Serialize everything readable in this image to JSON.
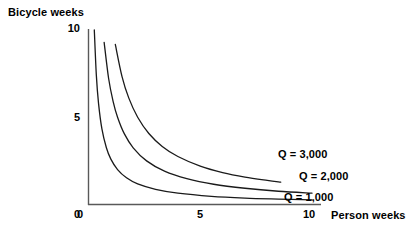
{
  "chart_data": {
    "type": "line",
    "title": "",
    "xlabel": "Person weeks",
    "ylabel": "Bicycle weeks",
    "xlim": [
      0,
      11.5
    ],
    "ylim": [
      0,
      11.8
    ],
    "xticks": [
      "0",
      "5",
      "10"
    ],
    "xtick_values": [
      0,
      5,
      10
    ],
    "yticks": [
      "0",
      "5",
      "10"
    ],
    "ytick_values": [
      0,
      5,
      10
    ],
    "grid": false,
    "legend_position": "inline-right-of-curve-ends",
    "axis_color": "#4d4d4d",
    "curve_color": "#1a1a1a",
    "background": "#ffffff",
    "series": [
      {
        "name": "Q = 1,000",
        "label": "Q = 1,000",
        "constant": 2.6,
        "points": [
          {
            "x": 0.26,
            "y": 10.0
          },
          {
            "x": 0.35,
            "y": 7.43
          },
          {
            "x": 0.45,
            "y": 5.78
          },
          {
            "x": 0.6,
            "y": 4.33
          },
          {
            "x": 0.8,
            "y": 3.25
          },
          {
            "x": 1.0,
            "y": 2.6
          },
          {
            "x": 1.3,
            "y": 2.0
          },
          {
            "x": 1.7,
            "y": 1.53
          },
          {
            "x": 2.2,
            "y": 1.18
          },
          {
            "x": 3.0,
            "y": 0.87
          },
          {
            "x": 4.0,
            "y": 0.65
          },
          {
            "x": 5.5,
            "y": 0.47
          },
          {
            "x": 7.0,
            "y": 0.37
          },
          {
            "x": 8.5,
            "y": 0.31
          },
          {
            "x": 10.0,
            "y": 0.26
          }
        ]
      },
      {
        "name": "Q = 2,000",
        "label": "Q = 2,000",
        "constant": 6.5,
        "points": [
          {
            "x": 0.55,
            "y": 11.8
          },
          {
            "x": 0.7,
            "y": 9.29
          },
          {
            "x": 0.9,
            "y": 7.22
          },
          {
            "x": 1.1,
            "y": 5.91
          },
          {
            "x": 1.3,
            "y": 5.0
          },
          {
            "x": 1.6,
            "y": 4.06
          },
          {
            "x": 2.0,
            "y": 3.25
          },
          {
            "x": 2.6,
            "y": 2.5
          },
          {
            "x": 3.4,
            "y": 1.91
          },
          {
            "x": 4.4,
            "y": 1.48
          },
          {
            "x": 5.6,
            "y": 1.16
          },
          {
            "x": 7.0,
            "y": 0.93
          },
          {
            "x": 8.5,
            "y": 0.76
          },
          {
            "x": 10.0,
            "y": 0.65
          }
        ]
      },
      {
        "name": "Q = 3,000",
        "label": "Q = 3,000",
        "constant": 11.0,
        "points": [
          {
            "x": 0.95,
            "y": 11.6
          },
          {
            "x": 1.2,
            "y": 9.17
          },
          {
            "x": 1.5,
            "y": 7.33
          },
          {
            "x": 1.8,
            "y": 6.11
          },
          {
            "x": 2.2,
            "y": 5.0
          },
          {
            "x": 2.7,
            "y": 4.07
          },
          {
            "x": 3.3,
            "y": 3.33
          },
          {
            "x": 4.0,
            "y": 2.75
          },
          {
            "x": 5.0,
            "y": 2.2
          },
          {
            "x": 6.0,
            "y": 1.83
          },
          {
            "x": 7.0,
            "y": 1.57
          },
          {
            "x": 8.0,
            "y": 1.38
          },
          {
            "x": 8.6,
            "y": 1.28
          }
        ]
      }
    ]
  },
  "axes": {
    "y_axis_title": "Bicycle weeks",
    "x_axis_title": "Person weeks",
    "y_ticks": [
      {
        "label": "10"
      },
      {
        "label": "5"
      },
      {
        "label": "0"
      }
    ],
    "x_ticks": [
      {
        "label": "0"
      },
      {
        "label": "5"
      },
      {
        "label": "10"
      }
    ]
  }
}
